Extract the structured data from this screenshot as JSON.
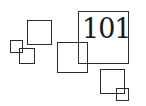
{
  "logo": {
    "number_text": "101",
    "stroke_color": "#2b2b2b",
    "text_color": "#1a1a1a",
    "background": "#ffffff"
  }
}
